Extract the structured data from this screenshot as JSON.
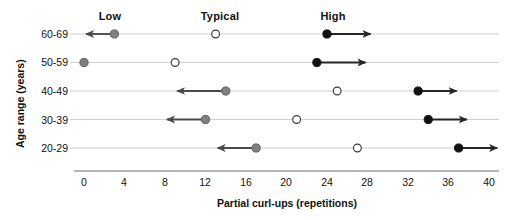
{
  "chart_data": {
    "type": "scatter",
    "title": "",
    "xlabel": "Partial curl-ups (repetitions)",
    "ylabel": "Age range (years)",
    "xlim": [
      0,
      40
    ],
    "xticks": [
      0,
      4,
      8,
      12,
      16,
      20,
      24,
      28,
      32,
      36,
      40
    ],
    "xtick_labels": [
      "0",
      "4",
      "8",
      "12",
      "16",
      "20",
      "24",
      "28",
      "32",
      "36",
      "40"
    ],
    "categories": [
      "60-69",
      "50-59",
      "40-49",
      "30-39",
      "20-29"
    ],
    "grid": false,
    "legend_position": "top",
    "column_headers": [
      "Low",
      "Typical",
      "High"
    ],
    "series": [
      {
        "name": "Low",
        "marker": "filled-gray-circle",
        "color": "#808080",
        "arrow": "left",
        "values": [
          3,
          0,
          14,
          12,
          17
        ]
      },
      {
        "name": "Typical",
        "marker": "open-circle",
        "color": "#ffffff",
        "arrow": "none",
        "values": [
          13,
          9,
          25,
          21,
          27
        ]
      },
      {
        "name": "High",
        "marker": "filled-black-circle",
        "color": "#111111",
        "arrow": "right",
        "values": [
          24,
          23,
          33,
          34,
          37
        ]
      }
    ],
    "arrow_ends": {
      "Low": [
        0,
        null,
        9,
        8,
        13
      ],
      "High": [
        28.5,
        28,
        37,
        38,
        41
      ]
    },
    "rows": [
      {
        "category": "60-69",
        "low": 3,
        "typical": 13,
        "high": 24,
        "low_arrow_to": 0,
        "high_arrow_to": 28.5
      },
      {
        "category": "50-59",
        "low": 0,
        "typical": 9,
        "high": 23,
        "low_arrow_to": null,
        "high_arrow_to": 28
      },
      {
        "category": "40-49",
        "low": 14,
        "typical": 25,
        "high": 33,
        "low_arrow_to": 9,
        "high_arrow_to": 37
      },
      {
        "category": "30-39",
        "low": 12,
        "typical": 21,
        "high": 34,
        "low_arrow_to": 8,
        "high_arrow_to": 38
      },
      {
        "category": "20-29",
        "low": 17,
        "typical": 27,
        "high": 37,
        "low_arrow_to": 13,
        "high_arrow_to": 41
      }
    ]
  },
  "headers": {
    "low": "Low",
    "typical": "Typical",
    "high": "High"
  },
  "axes": {
    "x_title": "Partial curl-ups (repetitions)",
    "y_title": "Age range (years)"
  },
  "ylabels": {
    "r0": "60-69",
    "r1": "50-59",
    "r2": "40-49",
    "r3": "30-39",
    "r4": "20-29"
  },
  "xticks": {
    "t0": "0",
    "t1": "4",
    "t2": "8",
    "t3": "12",
    "t4": "16",
    "t5": "20",
    "t6": "24",
    "t7": "28",
    "t8": "32",
    "t9": "36",
    "t10": "40"
  },
  "colors": {
    "low_marker": "#808080",
    "typical_marker": "#ffffff",
    "high_marker": "#111111",
    "row_line": "#c9c9c9",
    "axis": "#6f6f6f",
    "arrow": "#333333",
    "text": "#111111"
  }
}
